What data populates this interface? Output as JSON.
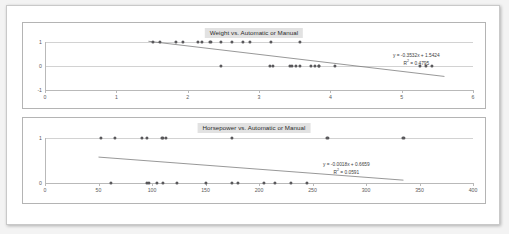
{
  "document": {
    "background_color": "#f3f3f3",
    "sheet_color": "#ffffff",
    "point_color": "#59585b",
    "trendline_color": "#6b6b6b"
  },
  "chart_data": [
    {
      "id": "weight-chart",
      "type": "scatter",
      "title": "Weight vs. Automatic or Manual",
      "xlabel": "",
      "ylabel": "",
      "xlim": [
        0,
        6
      ],
      "ylim": [
        -1,
        1
      ],
      "xticks": [
        0,
        1,
        2,
        3,
        4,
        5,
        6
      ],
      "yticks": [
        1,
        0,
        -1
      ],
      "grid": true,
      "legend": "none",
      "series": [
        {
          "name": "Automatic or Manual",
          "points": [
            [
              1.513,
              1
            ],
            [
              1.615,
              1
            ],
            [
              1.835,
              1
            ],
            [
              1.935,
              1
            ],
            [
              2.14,
              1
            ],
            [
              2.2,
              1
            ],
            [
              2.32,
              1
            ],
            [
              2.465,
              1
            ],
            [
              2.62,
              1
            ],
            [
              2.77,
              1
            ],
            [
              2.875,
              1
            ],
            [
              3.17,
              1
            ],
            [
              3.57,
              1
            ],
            [
              2.465,
              0
            ],
            [
              3.15,
              0
            ],
            [
              3.19,
              0
            ],
            [
              3.44,
              0
            ],
            [
              3.46,
              0
            ],
            [
              3.52,
              0
            ],
            [
              3.57,
              0
            ],
            [
              3.73,
              0
            ],
            [
              3.78,
              0
            ],
            [
              3.84,
              0
            ],
            [
              3.845,
              0
            ],
            [
              4.07,
              0
            ],
            [
              5.25,
              0
            ],
            [
              5.345,
              0
            ],
            [
              5.424,
              0
            ]
          ]
        }
      ],
      "trendline": {
        "equation": "y = -0.3532x + 1.5424",
        "r_squared_label": "R² = 0.4795",
        "slope": -0.3532,
        "intercept": 1.5424,
        "r_squared": 0.4795,
        "x_start": 1.45,
        "x_end": 5.6
      },
      "annotation": {
        "equation": "y = -0.3532x + 1.5424",
        "r2": "R",
        "r2_sup": "2",
        "r2_value": " = 0.4795"
      }
    },
    {
      "id": "horsepower-chart",
      "type": "scatter",
      "title": "Horsepower vs. Automatic or Manual",
      "xlabel": "",
      "ylabel": "",
      "xlim": [
        0,
        400
      ],
      "ylim": [
        0,
        1
      ],
      "xticks": [
        0,
        50,
        100,
        150,
        200,
        250,
        300,
        350,
        400
      ],
      "yticks": [
        1,
        0
      ],
      "grid": true,
      "legend": "none",
      "series": [
        {
          "name": "Automatic or Manual",
          "points": [
            [
              52,
              1
            ],
            [
              65,
              1
            ],
            [
              91,
              1
            ],
            [
              95,
              1
            ],
            [
              109,
              1
            ],
            [
              113,
              1
            ],
            [
              110,
              1
            ],
            [
              175,
              1
            ],
            [
              264,
              1
            ],
            [
              335,
              1
            ],
            [
              62,
              0
            ],
            [
              95,
              0
            ],
            [
              97,
              0
            ],
            [
              105,
              0
            ],
            [
              110,
              0
            ],
            [
              123,
              0
            ],
            [
              150,
              0
            ],
            [
              175,
              0
            ],
            [
              180,
              0
            ],
            [
              205,
              0
            ],
            [
              215,
              0
            ],
            [
              230,
              0
            ],
            [
              245,
              0
            ]
          ]
        }
      ],
      "trendline": {
        "equation": "y = -0.0018x + 0.6659",
        "r_squared_label": "R² = 0.0591",
        "slope": -0.0018,
        "intercept": 0.6659,
        "r_squared": 0.0591,
        "x_start": 50,
        "x_end": 335
      },
      "annotation": {
        "equation": "y = -0.0018x + 0.6659",
        "r2": "R",
        "r2_sup": "2",
        "r2_value": " = 0.0591"
      }
    }
  ]
}
